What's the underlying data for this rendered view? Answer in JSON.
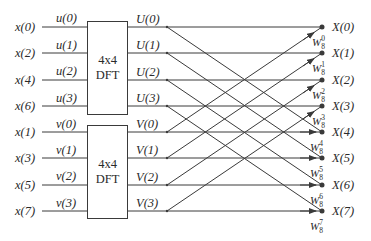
{
  "diagram": {
    "type": "8-point decimation-in-time FFT flow graph using two 4-point DFTs",
    "inputs_even": [
      "x(0)",
      "x(2)",
      "x(4)",
      "x(6)"
    ],
    "inputs_odd": [
      "x(1)",
      "x(3)",
      "x(5)",
      "x(7)"
    ],
    "dft_inputs_u": [
      "u(0)",
      "u(1)",
      "u(2)",
      "u(3)"
    ],
    "dft_inputs_v": [
      "v(0)",
      "v(1)",
      "v(2)",
      "v(3)"
    ],
    "blocks": [
      {
        "line1": "4x4",
        "line2": "DFT"
      },
      {
        "line1": "4x4",
        "line2": "DFT"
      }
    ],
    "dft_outputs_U": [
      "U(0)",
      "U(1)",
      "U(2)",
      "U(3)"
    ],
    "dft_outputs_V": [
      "V(0)",
      "V(1)",
      "V(2)",
      "V(3)"
    ],
    "outputs": [
      "X(0)",
      "X(1)",
      "X(2)",
      "X(3)",
      "X(4)",
      "X(5)",
      "X(6)",
      "X(7)"
    ],
    "twiddles": [
      {
        "base": "W",
        "sub": "8",
        "sup": "0"
      },
      {
        "base": "W",
        "sub": "8",
        "sup": "1"
      },
      {
        "base": "W",
        "sub": "8",
        "sup": "2"
      },
      {
        "base": "W",
        "sub": "8",
        "sup": "3"
      },
      {
        "base": "W",
        "sub": "8",
        "sup": "4"
      },
      {
        "base": "W",
        "sub": "8",
        "sup": "5"
      },
      {
        "base": "W",
        "sub": "8",
        "sup": "6"
      },
      {
        "base": "W",
        "sub": "8",
        "sup": "7"
      }
    ],
    "colors": {
      "line": "#3a3a3a",
      "text": "#2a2a2a",
      "background": "#ffffff"
    }
  }
}
